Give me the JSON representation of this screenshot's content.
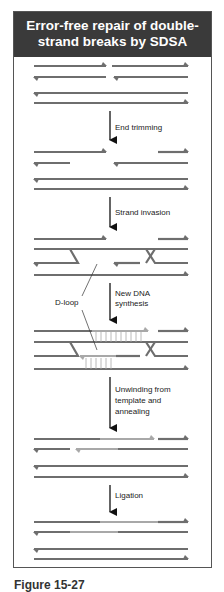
{
  "figure": {
    "title_line1": "Error-free repair of double-",
    "title_line2": "strand breaks by SDSA",
    "steps": [
      {
        "label": "End trimming"
      },
      {
        "label": "Strand invasion"
      },
      {
        "label_line1": "New DNA",
        "label_line2": "synthesis"
      },
      {
        "label_line1": "Unwinding from",
        "label_line2": "template and",
        "label_line3": "annealing"
      },
      {
        "label": "Ligation"
      }
    ],
    "annotations": {
      "dloop": "D-loop"
    },
    "colors": {
      "header_bg": "#3a3a3a",
      "strand_dark": "#6e6e6e",
      "strand_new": "#a8a8a8",
      "arrow": "#111111",
      "border": "#555555"
    },
    "caption": "Figure 15-27"
  }
}
